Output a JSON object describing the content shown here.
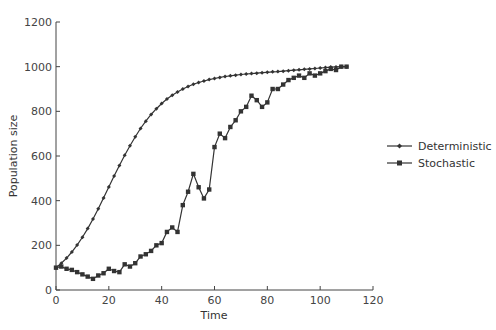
{
  "chart_data": {
    "type": "line",
    "title": "",
    "xlabel": "Time",
    "ylabel": "Population size",
    "xlim": [
      0,
      120
    ],
    "ylim": [
      0,
      1200
    ],
    "xticks": [
      0,
      20,
      40,
      60,
      80,
      100,
      120
    ],
    "yticks": [
      0,
      200,
      400,
      600,
      800,
      1000,
      1200
    ],
    "grid": false,
    "legend_position": "right",
    "series": [
      {
        "name": "Deterministic",
        "marker": "diamond",
        "x": [
          0,
          2,
          4,
          6,
          8,
          10,
          12,
          14,
          16,
          18,
          20,
          22,
          24,
          26,
          28,
          30,
          32,
          34,
          36,
          38,
          40,
          42,
          44,
          46,
          48,
          50,
          52,
          54,
          56,
          58,
          60,
          62,
          64,
          66,
          68,
          70,
          72,
          74,
          76,
          78,
          80,
          82,
          84,
          86,
          88,
          90,
          92,
          94,
          96,
          98,
          100,
          102,
          104,
          106,
          108,
          110
        ],
        "values": [
          100,
          120,
          143,
          170,
          201,
          236,
          275,
          318,
          364,
          412,
          461,
          510,
          557,
          603,
          646,
          686,
          723,
          756,
          786,
          812,
          835,
          855,
          872,
          887,
          900,
          911,
          921,
          929,
          936,
          942,
          947,
          952,
          956,
          959,
          962,
          965,
          967,
          969,
          971,
          973,
          975,
          977,
          978,
          980,
          982,
          984,
          986,
          988,
          990,
          992,
          994,
          996,
          998,
          999,
          1000,
          1000
        ]
      },
      {
        "name": "Stochastic",
        "marker": "square",
        "x": [
          0,
          2,
          4,
          6,
          8,
          10,
          12,
          14,
          16,
          18,
          20,
          22,
          24,
          26,
          28,
          30,
          32,
          34,
          36,
          38,
          40,
          42,
          44,
          46,
          48,
          50,
          52,
          54,
          56,
          58,
          60,
          62,
          64,
          66,
          68,
          70,
          72,
          74,
          76,
          78,
          80,
          82,
          84,
          86,
          88,
          90,
          92,
          94,
          96,
          98,
          100,
          102,
          104,
          106,
          108,
          110
        ],
        "values": [
          100,
          105,
          95,
          90,
          80,
          70,
          60,
          50,
          65,
          75,
          95,
          85,
          80,
          115,
          105,
          120,
          150,
          160,
          175,
          200,
          210,
          260,
          280,
          260,
          380,
          440,
          520,
          460,
          410,
          450,
          640,
          700,
          680,
          730,
          760,
          800,
          820,
          870,
          850,
          820,
          840,
          900,
          900,
          920,
          940,
          950,
          960,
          950,
          970,
          960,
          970,
          980,
          990,
          985,
          1000,
          1000
        ]
      }
    ]
  },
  "legend": {
    "items": [
      {
        "label": "Deterministic"
      },
      {
        "label": "Stochastic"
      }
    ]
  }
}
